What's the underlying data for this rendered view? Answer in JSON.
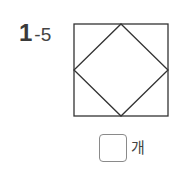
{
  "problem": {
    "number_main": "1",
    "number_sub": "-5"
  },
  "figure": {
    "outer_square": {
      "x1": 1,
      "y1": 1,
      "x2": 95,
      "y2": 93
    },
    "diamond_points": "48,1 95,47 48,93 1,47",
    "stroke_color": "#333333"
  },
  "answer": {
    "value": "",
    "unit": "개"
  }
}
